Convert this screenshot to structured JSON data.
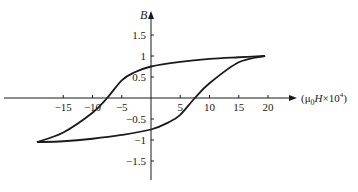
{
  "chart_data": {
    "type": "line",
    "title": "",
    "xlabel": "(μ0H×10^4)",
    "xlabel_parts": {
      "open": "(μ",
      "sub": "0",
      "italic": "H",
      "times": "×10",
      "sup": "4",
      "close": ")"
    },
    "ylabel": "B",
    "xlim": [
      -20,
      22
    ],
    "ylim": [
      -1.8,
      2.0
    ],
    "grid": false,
    "legend": null,
    "x_ticks": [
      -15,
      -10,
      -5,
      5,
      10,
      15,
      20
    ],
    "x_tick_labels": [
      "−15",
      "−10",
      "−5",
      "5",
      "10",
      "15",
      "20"
    ],
    "y_ticks": [
      1.5,
      1,
      0.5,
      -0.5,
      -1,
      -1.5
    ],
    "y_tick_labels": [
      "1.5",
      "1",
      "0.5",
      "−0.5",
      "−1",
      "−1.5"
    ],
    "series": [
      {
        "name": "upper branch (decreasing H)",
        "x": [
          19.5,
          15,
          10,
          5,
          0,
          -3,
          -5,
          -7.5,
          -10,
          -15,
          -19.5
        ],
        "y": [
          1.0,
          0.97,
          0.93,
          0.86,
          0.75,
          0.6,
          0.42,
          0.0,
          -0.35,
          -0.82,
          -1.05
        ]
      },
      {
        "name": "lower branch (increasing H)",
        "x": [
          -19.5,
          -15,
          -10,
          -5,
          0,
          3,
          5,
          7.5,
          10,
          15,
          19.5
        ],
        "y": [
          -1.05,
          -1.03,
          -0.97,
          -0.88,
          -0.75,
          -0.58,
          -0.4,
          0.0,
          0.35,
          0.85,
          1.0
        ]
      }
    ],
    "annotations": [
      "Hysteresis loop: coercivity ≈ ±7.5, remanence ≈ ±0.75, saturation ≈ ±1.0"
    ]
  }
}
